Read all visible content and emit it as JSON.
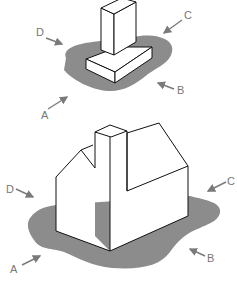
{
  "diagram": {
    "type": "foundation-footing-illustration",
    "colors": {
      "ground_shadow": "#8c8c8c",
      "outline": "#111111",
      "arrow": "#7a7a7a",
      "label": "#777777"
    },
    "figures": [
      {
        "name": "column-footing",
        "labels": {
          "a": "A",
          "b": "B",
          "c": "C",
          "d": "D"
        }
      },
      {
        "name": "house-foundation",
        "labels": {
          "a": "A",
          "b": "B",
          "c": "C",
          "d": "D"
        }
      }
    ]
  }
}
